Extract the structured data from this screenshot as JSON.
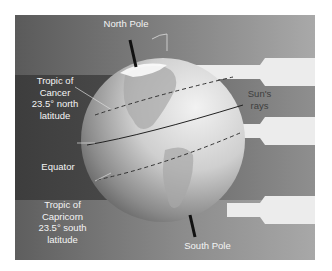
{
  "diagram": {
    "type": "earth-axial-tilt",
    "labels": {
      "north_pole": "North Pole",
      "south_pole": "South Pole",
      "tropic_cancer": [
        "Tropic of",
        "Cancer",
        "23.5° north",
        "latitude"
      ],
      "equator": "Equator",
      "tropic_capricorn": [
        "Tropic of",
        "Capricorn",
        "23.5° south",
        "latitude"
      ],
      "sun_rays": [
        "Sun's",
        "rays"
      ]
    },
    "tilt_degrees": 23.5,
    "colors": {
      "background_dark": "#454545",
      "background_light": "#9a9a9a",
      "ray": "#ececec",
      "globe_light": "#e2e2e2",
      "globe_shadow": "#6a6a6a",
      "axis": "#111111"
    }
  }
}
